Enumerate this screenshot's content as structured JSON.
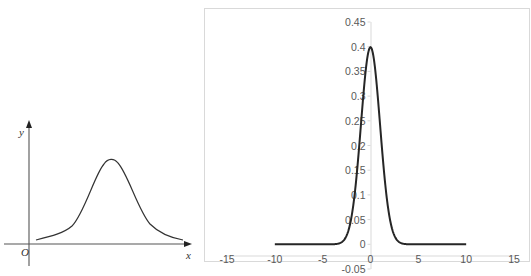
{
  "chart_data": [
    {
      "type": "line",
      "title": "",
      "description": "Schematic bell-shaped (normal distribution) curve, hand-drawn style, no numeric ticks",
      "xlabel": "x",
      "ylabel": "y",
      "origin_label": "O",
      "grid": false,
      "legend": null,
      "series": [
        {
          "name": "bell curve",
          "shape": "symmetric bell, peak near middle of x-range, tails approaching the x axis"
        }
      ]
    },
    {
      "type": "line",
      "title": "",
      "xlabel": "",
      "ylabel": "",
      "xlim": [
        -15,
        15
      ],
      "ylim": [
        -0.05,
        0.45
      ],
      "x_ticks": [
        "-15",
        "-10",
        "-5",
        "0",
        "5",
        "10",
        "15"
      ],
      "y_ticks": [
        "-0.05",
        "0",
        "0.05",
        "0.1",
        "0.15",
        "0.2",
        "0.25",
        "0.3",
        "0.35",
        "0.4",
        "0.45"
      ],
      "grid": false,
      "legend": null,
      "series": [
        {
          "name": "standard normal pdf",
          "x": [
            -10,
            -5,
            -4,
            -3,
            -2.5,
            -2,
            -1.5,
            -1,
            -0.5,
            0,
            0.5,
            1,
            1.5,
            2,
            2.5,
            3,
            4,
            5,
            10
          ],
          "values": [
            0,
            1.5e-06,
            0.0001,
            0.0044,
            0.0175,
            0.054,
            0.1295,
            0.242,
            0.3521,
            0.3989,
            0.3521,
            0.242,
            0.1295,
            0.054,
            0.0175,
            0.0044,
            0.0001,
            1.5e-06,
            0
          ]
        }
      ]
    }
  ],
  "left_chart": {
    "x_axis_label": "x",
    "y_axis_label": "y",
    "origin_label": "O"
  },
  "right_chart": {
    "x_tick_labels": [
      "-15",
      "-10",
      "-5",
      "0",
      "5",
      "10",
      "15"
    ],
    "y_tick_labels": [
      "0.45",
      "0.4",
      "0.35",
      "0.3",
      "0.25",
      "0.2",
      "0.15",
      "0.1",
      "0.05",
      "0",
      "-0.05"
    ]
  },
  "colors": {
    "curve": "#262626",
    "axis": "#d9d9d9",
    "left_axis": "#555555",
    "tick_text": "#595959"
  }
}
